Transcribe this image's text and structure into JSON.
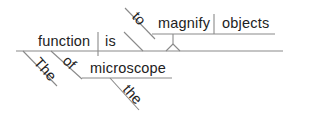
{
  "diagram": {
    "type": "sentence-diagram",
    "sentence_words": [
      "The",
      "function",
      "of",
      "the",
      "microscope",
      "is",
      "to",
      "magnify",
      "objects"
    ],
    "words": {
      "subject": "function",
      "verb": "is",
      "subject_modifier": "The",
      "preposition": "of",
      "prep_object": "microscope",
      "prep_object_modifier": "the",
      "infinitive_marker": "to",
      "infinitive_verb": "magnify",
      "infinitive_object": "objects"
    },
    "colors": {
      "line": "#8a8a8a",
      "text": "#222222",
      "background": "#ffffff"
    }
  }
}
